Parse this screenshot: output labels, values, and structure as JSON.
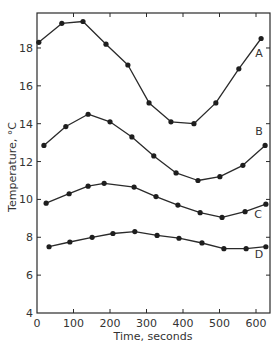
{
  "chart_data": {
    "type": "line",
    "title": "",
    "xlabel": "Time, seconds",
    "ylabel": "Temperature, °C",
    "xlim": [
      0,
      638
    ],
    "ylim": [
      4,
      19.85
    ],
    "xticks": [
      0,
      100,
      200,
      300,
      400,
      500,
      600
    ],
    "yticks": [
      4,
      6,
      8,
      10,
      12,
      14,
      16,
      18
    ],
    "grid": false,
    "legend": "inline labels at right end of each curve",
    "series": [
      {
        "name": "A",
        "x": [
          5,
          68,
          126,
          189,
          249,
          307,
          367,
          430,
          490,
          553,
          614
        ],
        "y": [
          18.3,
          19.3,
          19.4,
          18.2,
          17.1,
          15.1,
          14.1,
          14.0,
          15.1,
          16.9,
          18.5
        ],
        "label_pos": [
          259,
          57
        ]
      },
      {
        "name": "B",
        "x": [
          19,
          79,
          140,
          200,
          260,
          320,
          381,
          441,
          501,
          564,
          625
        ],
        "y": [
          12.85,
          13.85,
          14.5,
          14.1,
          13.3,
          12.3,
          11.4,
          11.0,
          11.2,
          11.8,
          12.85
        ],
        "label_pos": [
          259,
          135
        ]
      },
      {
        "name": "C",
        "x": [
          25,
          88,
          140,
          184,
          266,
          326,
          386,
          447,
          507,
          570,
          627
        ],
        "y": [
          9.8,
          10.3,
          10.7,
          10.85,
          10.65,
          10.15,
          9.7,
          9.3,
          9.05,
          9.35,
          9.75
        ],
        "label_pos": [
          258,
          218
        ]
      },
      {
        "name": "D",
        "x": [
          33,
          90,
          151,
          208,
          268,
          329,
          389,
          452,
          512,
          573,
          627
        ],
        "y": [
          7.5,
          7.75,
          8.0,
          8.2,
          8.3,
          8.1,
          7.95,
          7.7,
          7.4,
          7.4,
          7.5
        ],
        "label_pos": [
          259,
          258
        ]
      }
    ]
  },
  "layout": {
    "frame": {
      "left": 37,
      "right": 270,
      "top": 13,
      "bottom": 313
    },
    "x0_px": 37,
    "px_per_x": 0.365,
    "y4_px": 313,
    "px_per_y": 18.93
  },
  "colors": {
    "ink": "#2a2a2a",
    "dot": "#1e1e1e",
    "text": "#333333",
    "background": "#ffffff"
  }
}
